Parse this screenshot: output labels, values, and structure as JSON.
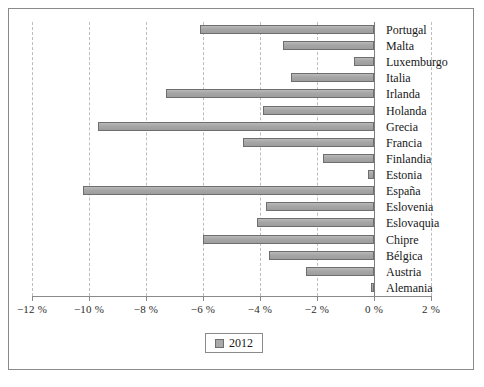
{
  "chart_data": {
    "type": "bar",
    "orientation": "horizontal",
    "title": "",
    "subtitle": "",
    "xlabel": "",
    "ylabel": "",
    "xlim": [
      -12,
      2
    ],
    "ylim": null,
    "grid": "vertical dashed gridlines at every 2 %",
    "legend": {
      "position": "bottom-center",
      "entries": [
        "2012"
      ]
    },
    "xtick_labels": [
      "−12 %",
      "−10 %",
      "−8 %",
      "−6 %",
      "−4 %",
      "−2 %",
      "0 %",
      "2 %"
    ],
    "xtick_values": [
      -12,
      -10,
      -8,
      -6,
      -4,
      -2,
      0,
      2
    ],
    "categories": [
      "Portugal",
      "Malta",
      "Luxemburgo",
      "Italia",
      "Irlanda",
      "Holanda",
      "Grecia",
      "Francia",
      "Finlandia",
      "Estonia",
      "España",
      "Eslovenia",
      "Eslovaquia",
      "Chipre",
      "Bélgica",
      "Austria",
      "Alemania"
    ],
    "series": [
      {
        "name": "2012",
        "color": "#a9a9a9",
        "values": [
          -6.1,
          -3.2,
          -0.7,
          -2.9,
          -7.3,
          -3.9,
          -9.7,
          -4.6,
          -1.8,
          -0.2,
          -10.2,
          -3.8,
          -4.1,
          -6.0,
          -3.7,
          -2.4,
          -0.1
        ]
      }
    ],
    "units": "%"
  },
  "legend": {
    "label": "2012",
    "swatch_color": "#a9a9a9"
  }
}
